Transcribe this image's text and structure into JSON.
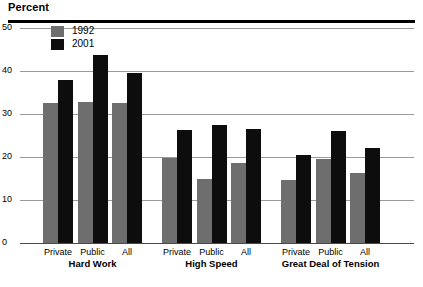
{
  "chart_data": {
    "type": "bar",
    "title": "Percent",
    "xlabel": "",
    "ylabel": "Percent",
    "ylim": [
      0,
      50
    ],
    "yticks": [
      0,
      10,
      20,
      30,
      40,
      50
    ],
    "ytick_labels": [
      "0",
      "10",
      "20",
      "30",
      "40",
      "50"
    ],
    "grid": true,
    "legend_position": "top-left",
    "categories": [
      "Private",
      "Public",
      "All",
      "Private",
      "Public",
      "All",
      "Private",
      "Public",
      "All"
    ],
    "groups": [
      {
        "label": "Hard Work",
        "categories": [
          "Private",
          "Public",
          "All"
        ],
        "series": [
          {
            "name": "1992",
            "values": [
              32.5,
              32.8,
              32.6
            ]
          },
          {
            "name": "2001",
            "values": [
              37.8,
              43.8,
              39.6
            ]
          }
        ]
      },
      {
        "label": "High Speed",
        "categories": [
          "Private",
          "Public",
          "All"
        ],
        "series": [
          {
            "name": "1992",
            "values": [
              19.8,
              15.0,
              18.5
            ]
          },
          {
            "name": "2001",
            "values": [
              26.3,
              27.4,
              26.6
            ]
          }
        ]
      },
      {
        "label": "Great Deal of Tension",
        "categories": [
          "Private",
          "Public",
          "All"
        ],
        "series": [
          {
            "name": "1992",
            "values": [
              14.6,
              19.5,
              16.3
            ]
          },
          {
            "name": "2001",
            "values": [
              20.5,
              26.0,
              22.0
            ]
          }
        ]
      }
    ],
    "series": [
      {
        "name": "1992",
        "color": "#6e6e6e",
        "values": [
          32.5,
          32.8,
          32.6,
          19.8,
          15.0,
          18.5,
          14.6,
          19.5,
          16.3
        ]
      },
      {
        "name": "2001",
        "color": "#0d0d0d",
        "values": [
          37.8,
          43.8,
          39.6,
          26.3,
          27.4,
          26.6,
          20.5,
          26.0,
          22.0
        ]
      }
    ]
  },
  "legend": {
    "items": [
      {
        "label": "1992",
        "color": "#6e6e6e"
      },
      {
        "label": "2001",
        "color": "#0d0d0d"
      }
    ]
  },
  "colors": {
    "series_1992": "#6e6e6e",
    "series_2001": "#0d0d0d",
    "gridline": "#9a9a9a",
    "rule": "#000000",
    "background": "#ffffff"
  }
}
